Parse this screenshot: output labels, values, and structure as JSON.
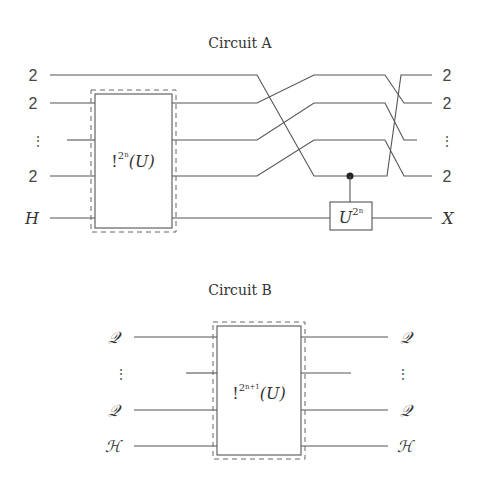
{
  "circuit_a": {
    "title": "Circuit A",
    "inputs": [
      "2",
      "2",
      "⋮",
      "2",
      "H"
    ],
    "outputs": [
      "2",
      "2",
      "⋮",
      "2",
      "X"
    ],
    "box_gate": {
      "prefix": "!",
      "sup": "2",
      "sup_sub": "n",
      "arg": "(U)"
    },
    "controlled_gate": {
      "base": "U",
      "sup": "2",
      "sup_sub": "n"
    }
  },
  "circuit_b": {
    "title": "Circuit B",
    "inputs": [
      "𝒬",
      "⋮",
      "𝒬",
      "ℋ"
    ],
    "outputs": [
      "𝒬",
      "⋮",
      "𝒬",
      "ℋ"
    ],
    "box_gate": {
      "prefix": "!",
      "sup": "2",
      "sup_sub": "n+1",
      "arg": "(U)"
    }
  },
  "colors": {
    "line": "#555555",
    "text": "#333333",
    "background": "#ffffff"
  }
}
